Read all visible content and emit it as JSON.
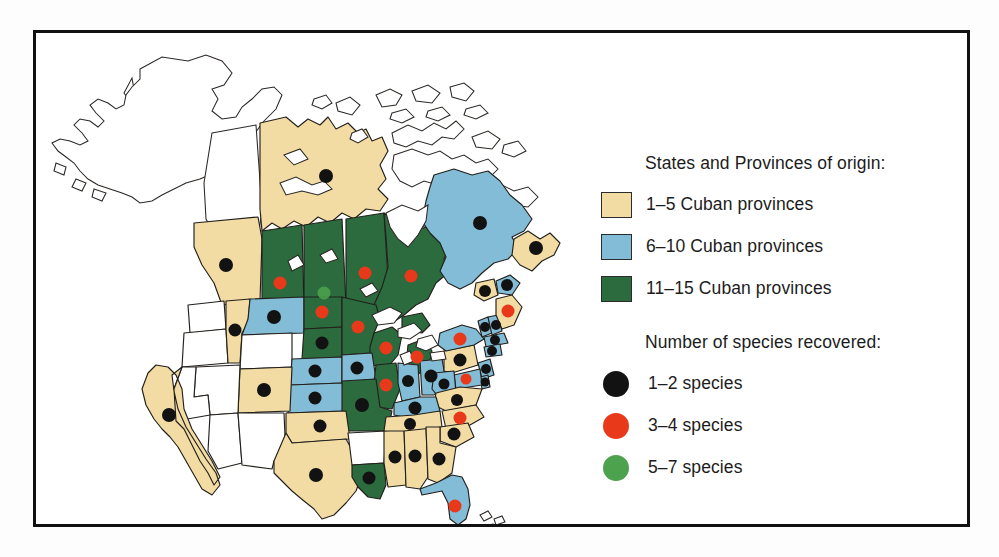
{
  "figure": {
    "kind": "choropleth-map",
    "region": "North America",
    "background_color": "#ffffff",
    "frame_color": "#111111"
  },
  "legend": {
    "groups": [
      {
        "id": "origin",
        "title": "States and Provinces of origin:",
        "swatch_type": "box",
        "items": [
          {
            "label": "1–5 Cuban provinces",
            "color": "#f2dca4"
          },
          {
            "label": "6–10 Cuban provinces",
            "color": "#82bcd6"
          },
          {
            "label": "11–15 Cuban provinces",
            "color": "#2b6b3e"
          }
        ]
      },
      {
        "id": "species",
        "title": "Number of species recovered:",
        "swatch_type": "dot",
        "items": [
          {
            "label": "1–2 species",
            "color": "#121212"
          },
          {
            "label": "3–4 species",
            "color": "#e8391b"
          },
          {
            "label": "5–7 species",
            "color": "#4da34d"
          }
        ]
      }
    ]
  },
  "map_data": {
    "type": "choropleth",
    "fill_classes": {
      "none": "#ffffff",
      "tan": "#f2dca4",
      "blue": "#82bcd6",
      "green": "#2b6b3e"
    },
    "dot_classes": {
      "black": "#121212",
      "red": "#e8391b",
      "green": "#4da34d"
    },
    "regions": [
      {
        "name": "Alaska",
        "fill": "none",
        "dot": null
      },
      {
        "name": "Yukon",
        "fill": "none",
        "dot": null
      },
      {
        "name": "Northwest Territories",
        "fill": "tan",
        "dot": "black"
      },
      {
        "name": "Nunavut",
        "fill": "none",
        "dot": null
      },
      {
        "name": "British Columbia",
        "fill": "tan",
        "dot": "black"
      },
      {
        "name": "Alberta",
        "fill": "green",
        "dot": "red"
      },
      {
        "name": "Saskatchewan",
        "fill": "green",
        "dot": "green"
      },
      {
        "name": "Manitoba",
        "fill": "green",
        "dot": "red"
      },
      {
        "name": "Ontario",
        "fill": "green",
        "dot": "red"
      },
      {
        "name": "Quebec",
        "fill": "blue",
        "dot": "black"
      },
      {
        "name": "Newfoundland and Labrador",
        "fill": "tan",
        "dot": "black"
      },
      {
        "name": "New Brunswick",
        "fill": "tan",
        "dot": "black"
      },
      {
        "name": "Nova Scotia",
        "fill": "blue",
        "dot": "black"
      },
      {
        "name": "Washington",
        "fill": "none",
        "dot": null
      },
      {
        "name": "Oregon",
        "fill": "none",
        "dot": null
      },
      {
        "name": "Idaho",
        "fill": "tan",
        "dot": "black"
      },
      {
        "name": "Montana",
        "fill": "blue",
        "dot": "black"
      },
      {
        "name": "Wyoming",
        "fill": "none",
        "dot": null
      },
      {
        "name": "North Dakota",
        "fill": "green",
        "dot": "red"
      },
      {
        "name": "South Dakota",
        "fill": "green",
        "dot": "black"
      },
      {
        "name": "Minnesota",
        "fill": "green",
        "dot": "red"
      },
      {
        "name": "Wisconsin",
        "fill": "green",
        "dot": "red"
      },
      {
        "name": "Michigan",
        "fill": "green",
        "dot": "red"
      },
      {
        "name": "Nebraska",
        "fill": "blue",
        "dot": "black"
      },
      {
        "name": "Iowa",
        "fill": "blue",
        "dot": "black"
      },
      {
        "name": "Illinois",
        "fill": "green",
        "dot": "red"
      },
      {
        "name": "Indiana",
        "fill": "blue",
        "dot": "black"
      },
      {
        "name": "Ohio",
        "fill": "blue",
        "dot": "black"
      },
      {
        "name": "Pennsylvania",
        "fill": "tan",
        "dot": "black"
      },
      {
        "name": "New York",
        "fill": "blue",
        "dot": "red"
      },
      {
        "name": "Vermont",
        "fill": "blue",
        "dot": "black"
      },
      {
        "name": "New Hampshire",
        "fill": "blue",
        "dot": "black"
      },
      {
        "name": "Maine",
        "fill": "tan",
        "dot": "red"
      },
      {
        "name": "Massachusetts",
        "fill": "blue",
        "dot": "black"
      },
      {
        "name": "Connecticut",
        "fill": "blue",
        "dot": "black"
      },
      {
        "name": "New Jersey",
        "fill": "blue",
        "dot": "black"
      },
      {
        "name": "Delaware",
        "fill": "blue",
        "dot": "black"
      },
      {
        "name": "Maryland",
        "fill": "blue",
        "dot": "red"
      },
      {
        "name": "Virginia",
        "fill": "tan",
        "dot": "black"
      },
      {
        "name": "West Virginia",
        "fill": "blue",
        "dot": "black"
      },
      {
        "name": "Kentucky",
        "fill": "blue",
        "dot": "black"
      },
      {
        "name": "Missouri",
        "fill": "green",
        "dot": "black"
      },
      {
        "name": "Kansas",
        "fill": "blue",
        "dot": "black"
      },
      {
        "name": "Colorado",
        "fill": "tan",
        "dot": "black"
      },
      {
        "name": "Utah",
        "fill": "none",
        "dot": null
      },
      {
        "name": "Nevada",
        "fill": "none",
        "dot": null
      },
      {
        "name": "California",
        "fill": "tan",
        "dot": "black"
      },
      {
        "name": "Arizona",
        "fill": "none",
        "dot": null
      },
      {
        "name": "New Mexico",
        "fill": "none",
        "dot": null
      },
      {
        "name": "Oklahoma",
        "fill": "tan",
        "dot": "black"
      },
      {
        "name": "Texas",
        "fill": "tan",
        "dot": "black"
      },
      {
        "name": "Arkansas",
        "fill": "none",
        "dot": null
      },
      {
        "name": "Louisiana",
        "fill": "green",
        "dot": "black"
      },
      {
        "name": "Mississippi",
        "fill": "tan",
        "dot": "black"
      },
      {
        "name": "Alabama",
        "fill": "tan",
        "dot": "black"
      },
      {
        "name": "Tennessee",
        "fill": "tan",
        "dot": "black"
      },
      {
        "name": "North Carolina",
        "fill": "tan",
        "dot": "red"
      },
      {
        "name": "South Carolina",
        "fill": "tan",
        "dot": "black"
      },
      {
        "name": "Georgia",
        "fill": "tan",
        "dot": "black"
      },
      {
        "name": "Florida",
        "fill": "blue",
        "dot": "red"
      }
    ]
  }
}
